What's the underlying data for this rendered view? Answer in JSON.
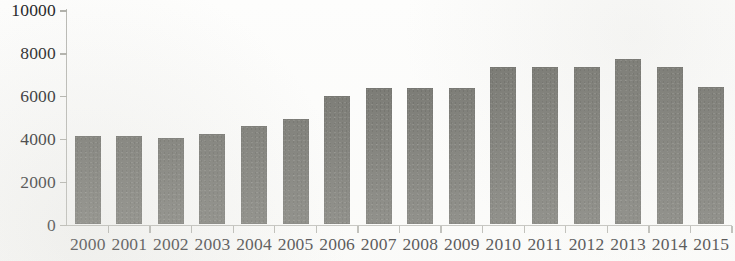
{
  "chart_data": {
    "type": "bar",
    "title": "",
    "subtitle": "",
    "xlabel": "",
    "ylabel": "",
    "categories": [
      "2000",
      "2001",
      "2002",
      "2003",
      "2004",
      "2005",
      "2006",
      "2007",
      "2008",
      "2009",
      "2010",
      "2011",
      "2012",
      "2013",
      "2014",
      "2015"
    ],
    "values": [
      4150,
      4150,
      4100,
      4280,
      4620,
      4950,
      6050,
      6400,
      6400,
      6400,
      7400,
      7380,
      7400,
      7750,
      7400,
      6450
    ],
    "series": [
      {
        "name": "",
        "values": [
          4150,
          4150,
          4100,
          4280,
          4620,
          4950,
          6050,
          6400,
          6400,
          6400,
          7400,
          7380,
          7400,
          7750,
          7400,
          6450
        ]
      }
    ],
    "ylim": [
      0,
      10000
    ],
    "ytick_labels": [
      "10000",
      "8000",
      "6000",
      "4000",
      "2000",
      "0"
    ],
    "ytick_values": [
      10000,
      8000,
      6000,
      4000,
      2000,
      0
    ],
    "grid": false,
    "legend": false,
    "legend_position": "none",
    "bar_color": "#6f6f69",
    "axis_color": "#b0b0aa",
    "text_color": "#202023",
    "background_color": "#fdfdfc",
    "annotations": []
  }
}
